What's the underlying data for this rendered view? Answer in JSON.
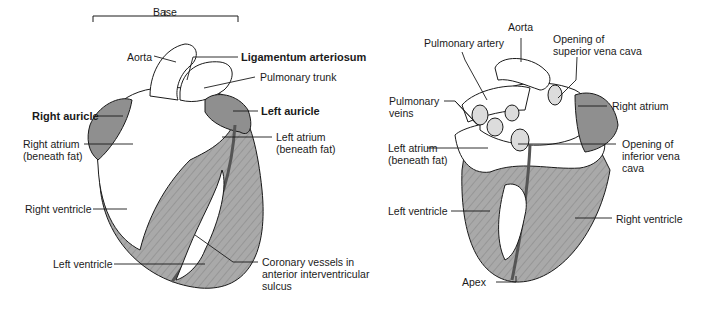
{
  "figure": {
    "anterior_view": {
      "labels": {
        "base": "Base",
        "aorta": "Aorta",
        "ligamentum_arteriosum": "Ligamentum arteriosum",
        "pulmonary_trunk": "Pulmonary trunk",
        "right_auricle": "Right auricle",
        "left_auricle": "Left auricle",
        "right_atrium_l1": "Right atrium",
        "right_atrium_l2": "(beneath fat)",
        "left_atrium_l1": "Left atrium",
        "left_atrium_l2": "(beneath fat)",
        "right_ventricle": "Right ventricle",
        "left_ventricle": "Left ventricle",
        "coronary_l1": "Coronary vessels in",
        "coronary_l2": "anterior interventricular",
        "coronary_l3": "sulcus"
      }
    },
    "posterior_view": {
      "labels": {
        "aorta": "Aorta",
        "pulmonary_artery": "Pulmonary artery",
        "svc_l1": "Opening of",
        "svc_l2": "superior vena cava",
        "pulmonary_veins_l1": "Pulmonary",
        "pulmonary_veins_l2": "veins",
        "right_atrium": "Right atrium",
        "left_atrium_l1": "Left atrium",
        "left_atrium_l2": "(beneath fat)",
        "ivc_l1": "Opening of",
        "ivc_l2": "inferior vena",
        "ivc_l3": "cava",
        "left_ventricle": "Left ventricle",
        "right_ventricle": "Right ventricle",
        "apex": "Apex"
      }
    },
    "colors": {
      "muscle": "#a9a9a9",
      "auricle": "#8f8f8f",
      "vessel": "#6e6e6e",
      "fat": "#ffffff",
      "line": "#1a1a1a"
    }
  }
}
